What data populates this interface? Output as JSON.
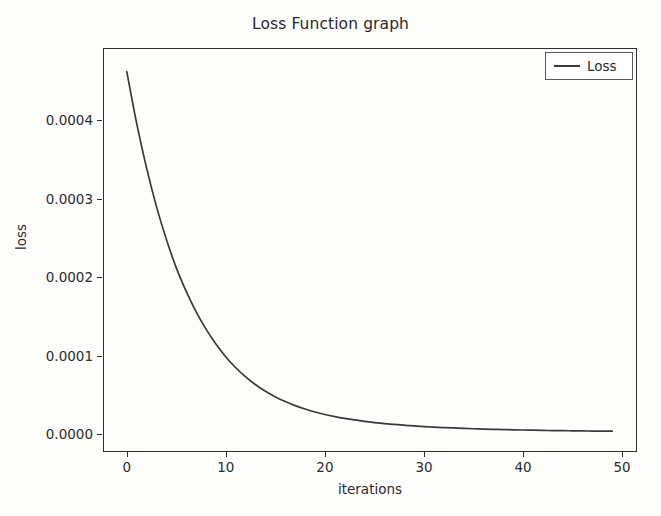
{
  "chart_data": {
    "type": "line",
    "title": "Loss Function graph",
    "xlabel": "iterations",
    "ylabel": "loss",
    "grid": false,
    "legend_position": "upper right",
    "xlim": [
      -2.4,
      51.5
    ],
    "ylim": [
      -2.25e-05,
      0.000492
    ],
    "xticks": [
      0,
      10,
      20,
      30,
      40,
      50
    ],
    "xtick_labels": [
      "0",
      "10",
      "20",
      "30",
      "40",
      "50"
    ],
    "yticks": [
      0.0,
      0.0001,
      0.0002,
      0.0003,
      0.0004
    ],
    "ytick_labels": [
      "0.0000",
      "0.0001",
      "0.0002",
      "0.0003",
      "0.0004"
    ],
    "series": [
      {
        "name": "Loss",
        "color": "#3a3a3a",
        "linewidth": 1.6,
        "x": [
          0,
          1,
          2,
          3,
          4,
          5,
          6,
          7,
          8,
          9,
          10,
          11,
          12,
          13,
          14,
          15,
          16,
          17,
          18,
          19,
          20,
          21,
          22,
          23,
          24,
          25,
          26,
          27,
          28,
          29,
          30,
          31,
          32,
          33,
          34,
          35,
          36,
          37,
          38,
          39,
          40,
          41,
          42,
          43,
          44,
          45,
          46,
          47,
          48,
          49
        ],
        "values": [
          0.000462,
          0.000396,
          0.000339,
          0.00029,
          0.000248,
          0.000212,
          0.000182,
          0.000156,
          0.000134,
          0.000115,
          9.85e-05,
          8.48e-05,
          7.31e-05,
          6.32e-05,
          5.48e-05,
          4.77e-05,
          4.17e-05,
          3.66e-05,
          3.22e-05,
          2.85e-05,
          2.53e-05,
          2.26e-05,
          2.03e-05,
          1.83e-05,
          1.65e-05,
          1.5e-05,
          1.37e-05,
          1.26e-05,
          1.16e-05,
          1.07e-05,
          9.9e-06,
          9.2e-06,
          8.6e-06,
          8.1e-06,
          7.6e-06,
          7.1e-06,
          6.7e-06,
          6.4e-06,
          6.1e-06,
          5.8e-06,
          5.5e-06,
          5.3e-06,
          5e-06,
          4.8e-06,
          4.7e-06,
          4.5e-06,
          4.3e-06,
          4.2e-06,
          4.1e-06,
          4e-06
        ]
      }
    ],
    "legend_entries": [
      "Loss"
    ]
  },
  "legend": {
    "label": "Loss"
  },
  "colors": {
    "line": "#3a3a3a",
    "axis": "#2e2e2e",
    "text": "#2b2b2b",
    "background": "#fdfdfc"
  }
}
